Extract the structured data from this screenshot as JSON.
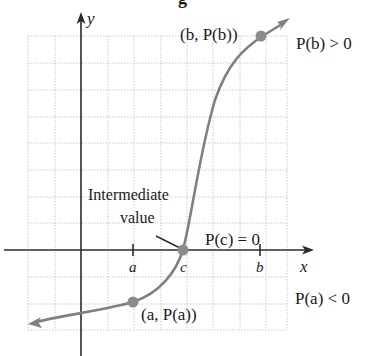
{
  "title_fragment": "g",
  "axes": {
    "x_label": "x",
    "y_label": "y"
  },
  "ticks": {
    "a": "a",
    "c": "c",
    "b": "b"
  },
  "points": {
    "b_point": "(b, P(b))",
    "a_point": "(a, P(a))"
  },
  "annotations": {
    "pb": "P(b) > 0",
    "pc": "P(c) = 0",
    "pa": "P(a) < 0",
    "intermediate_line1": "Intermediate",
    "intermediate_line2": "value"
  },
  "colors": {
    "curve": "#808080",
    "axis": "#2b2b2b",
    "grid": "#c8c8c8",
    "point": "#8c8c8c"
  }
}
